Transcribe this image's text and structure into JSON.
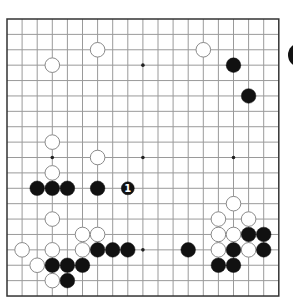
{
  "board": {
    "size": 19,
    "origin_x": 7,
    "origin_y": 19,
    "spacing_x": 15.1,
    "spacing_y": 15.39,
    "line_color": "#9a9a9a",
    "border_color": "#333333",
    "star_points": [
      [
        3,
        3
      ],
      [
        9,
        3
      ],
      [
        15,
        3
      ],
      [
        3,
        9
      ],
      [
        9,
        9
      ],
      [
        15,
        9
      ],
      [
        3,
        15
      ],
      [
        9,
        15
      ],
      [
        15,
        15
      ]
    ],
    "white_stones": [
      [
        6,
        2
      ],
      [
        13,
        2
      ],
      [
        3,
        3
      ],
      [
        3,
        8
      ],
      [
        6,
        9
      ],
      [
        3,
        10
      ],
      [
        15,
        12
      ],
      [
        3,
        13
      ],
      [
        14,
        13
      ],
      [
        16,
        13
      ],
      [
        5,
        14
      ],
      [
        6,
        14
      ],
      [
        14,
        14
      ],
      [
        15,
        14
      ],
      [
        1,
        15
      ],
      [
        3,
        15
      ],
      [
        5,
        15
      ],
      [
        14,
        15
      ],
      [
        16,
        15
      ],
      [
        2,
        16
      ],
      [
        3,
        17
      ]
    ],
    "black_stones": [
      [
        15,
        3
      ],
      [
        16,
        5
      ],
      [
        2,
        11
      ],
      [
        3,
        11
      ],
      [
        4,
        11
      ],
      [
        6,
        11
      ],
      [
        16,
        14
      ],
      [
        17,
        14
      ],
      [
        6,
        15
      ],
      [
        7,
        15
      ],
      [
        8,
        15
      ],
      [
        12,
        15
      ],
      [
        15,
        15
      ],
      [
        17,
        15
      ],
      [
        3,
        16
      ],
      [
        4,
        16
      ],
      [
        5,
        16
      ],
      [
        14,
        16
      ],
      [
        15,
        16
      ],
      [
        4,
        17
      ]
    ],
    "marked_moves": [
      {
        "col": 8,
        "row": 11,
        "color": "black",
        "label": "1"
      }
    ]
  },
  "to_play_indicator": {
    "color": "black",
    "partially_visible": true
  }
}
